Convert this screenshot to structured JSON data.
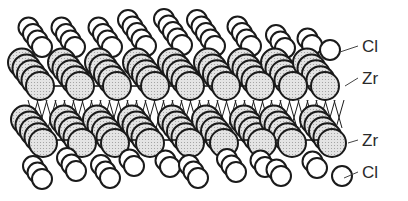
{
  "figure": {
    "labels": [
      {
        "id": "cl-top",
        "text": "Cl",
        "x": 362,
        "y": 38,
        "leader_from": [
          340,
          52
        ]
      },
      {
        "id": "zr-upper",
        "text": "Zr",
        "x": 362,
        "y": 70,
        "leader_from": [
          345,
          86
        ]
      },
      {
        "id": "zr-lower",
        "text": "Zr",
        "x": 362,
        "y": 132,
        "leader_from": [
          348,
          143
        ]
      },
      {
        "id": "cl-bottom",
        "text": "Cl",
        "x": 362,
        "y": 164,
        "leader_from": [
          344,
          178
        ]
      }
    ]
  },
  "layers": [
    {
      "name": "Cl",
      "position": "top",
      "fill": "#ffffff"
    },
    {
      "name": "Zr",
      "position": "upper-middle",
      "fill": "#dcdcdc"
    },
    {
      "name": "Zr",
      "position": "lower-middle",
      "fill": "#dcdcdc"
    },
    {
      "name": "Cl",
      "position": "bottom",
      "fill": "#ffffff"
    }
  ],
  "colors": {
    "outline": "#1a1a1a",
    "zr_fill": "#dedede",
    "cl_fill": "#ffffff",
    "text": "#2a2a2a"
  }
}
